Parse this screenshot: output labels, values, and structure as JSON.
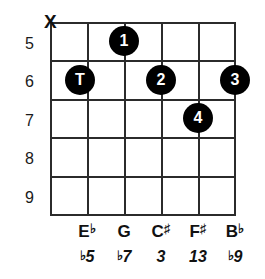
{
  "diagram": {
    "type": "guitar-chord-diagram",
    "strings": 6,
    "frets": 5,
    "colors": {
      "background": "#ffffff",
      "grid": "#2b2b2b",
      "dot_fill": "#000000",
      "dot_text": "#ffffff",
      "text": "#111111"
    },
    "fret_numbers": [
      "5",
      "6",
      "7",
      "8",
      "9"
    ],
    "string_markers": [
      {
        "string": 1,
        "symbol": "X",
        "meaning": "muted"
      }
    ],
    "finger_dots": [
      {
        "label": "1",
        "string": 2,
        "fret": 5
      },
      {
        "label": "T",
        "string": 1,
        "fret": 6
      },
      {
        "label": "2",
        "string": 3,
        "fret": 6
      },
      {
        "label": "3",
        "string": 5,
        "fret": 6
      },
      {
        "label": "4",
        "string": 4,
        "fret": 7
      }
    ],
    "note_labels": [
      {
        "string": 2,
        "note": "E",
        "accidental": "♭"
      },
      {
        "string": 3,
        "note": "G",
        "accidental": ""
      },
      {
        "string": 4,
        "note": "C",
        "accidental": "♯"
      },
      {
        "string": 5,
        "note": "F",
        "accidental": "♯"
      },
      {
        "string": 6,
        "note": "B",
        "accidental": "♭"
      }
    ],
    "interval_labels": [
      {
        "string": 2,
        "accidental": "♭",
        "degree": "5"
      },
      {
        "string": 3,
        "accidental": "♭",
        "degree": "7"
      },
      {
        "string": 4,
        "accidental": "",
        "degree": "3"
      },
      {
        "string": 5,
        "accidental": "",
        "degree": "13"
      },
      {
        "string": 6,
        "accidental": "♭",
        "degree": "9"
      }
    ]
  }
}
